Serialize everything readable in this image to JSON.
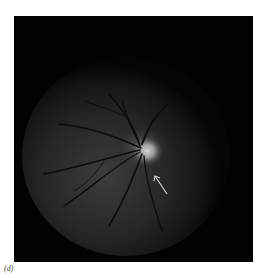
{
  "figure": {
    "panel_label": "(d)",
    "annotation": "arrow-pointer",
    "colors": {
      "background": "#020202",
      "fundus_glow": "#3a3a3a",
      "optic_disc": "#bdbdbd",
      "vessel": "#0a0a0a",
      "arrow": "#cfcfcf"
    }
  }
}
